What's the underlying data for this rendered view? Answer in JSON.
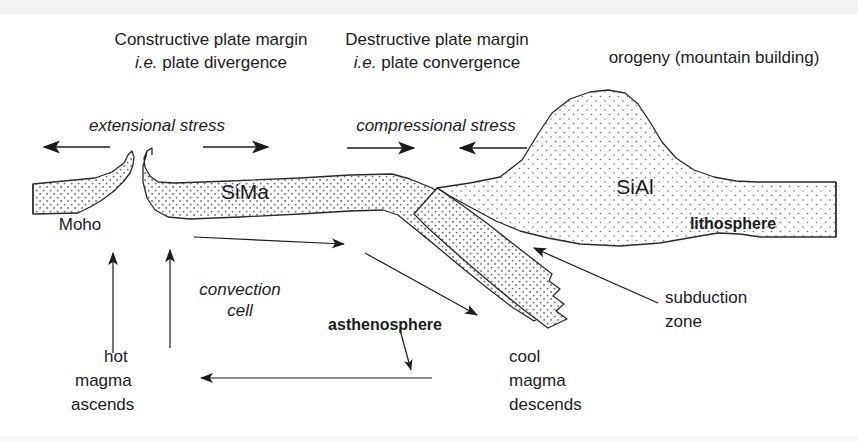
{
  "diagram": {
    "headings": [
      {
        "id": "constructive",
        "line1": "Constructive plate margin",
        "line2_prefix": "i.e.",
        "line2": " plate divergence"
      },
      {
        "id": "destructive",
        "line1": "Destructive plate margin",
        "line2_prefix": "i.e.",
        "line2": " plate convergence"
      }
    ],
    "orogeny_label": "orogeny (mountain building)",
    "stress_labels": {
      "extensional": "extensional stress",
      "compressional": "compressional stress"
    },
    "layer_labels": {
      "sima": "SiMa",
      "sial": "SiAl",
      "moho": "Moho",
      "lithosphere": "lithosphere",
      "asthenosphere": "asthenosphere"
    },
    "annotations": {
      "convection_line1": "convection",
      "convection_line2": "cell",
      "hot_line1": "hot",
      "hot_line2": "magma",
      "hot_line3": "ascends",
      "cool_line1": "cool",
      "cool_line2": "magma",
      "cool_line3": "descends",
      "subduction_line1": "subduction",
      "subduction_line2": "zone"
    },
    "arrows": [
      {
        "id": "extensional-left",
        "direction": "left",
        "label_group": "extensional stress"
      },
      {
        "id": "extensional-right",
        "direction": "right",
        "label_group": "extensional stress"
      },
      {
        "id": "compressional-left",
        "direction": "right",
        "label_group": "compressional stress"
      },
      {
        "id": "compressional-right",
        "direction": "left",
        "label_group": "compressional stress"
      },
      {
        "id": "convection-top",
        "direction": "right",
        "label_group": "convection cell"
      },
      {
        "id": "convection-bottom",
        "direction": "left",
        "label_group": "convection cell"
      },
      {
        "id": "magma-ascend-1",
        "direction": "up",
        "label_group": "hot magma ascends"
      },
      {
        "id": "magma-ascend-2",
        "direction": "up",
        "label_group": "hot magma ascends"
      },
      {
        "id": "magma-descend-1",
        "direction": "down-right",
        "label_group": "cool magma descends"
      },
      {
        "id": "magma-descend-2",
        "direction": "down-left",
        "label_group": "cool magma descends"
      },
      {
        "id": "subduction-leader",
        "direction": "up-left",
        "label_group": "subduction zone"
      }
    ],
    "colors": {
      "ink": "#1c1c1c",
      "outline": "#2a2a2a",
      "stipple": "#5a5a5a",
      "background": "#ffffff"
    }
  }
}
